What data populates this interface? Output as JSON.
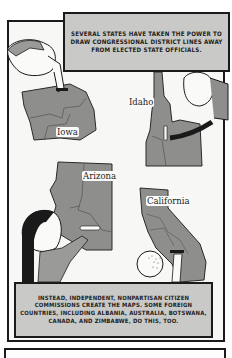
{
  "captions": {
    "top": "Several states have taken the power to draw congressional district lines away from elected state officials.",
    "bottom": "Instead, independent, nonpartisan citizen commissions create the maps. Some foreign countries, including Albania, Australia, Botswana, Canada, and Zimbabwe, do this, too."
  },
  "state_labels": {
    "iowa": "Iowa",
    "idaho": "Idaho",
    "arizona": "Arizona",
    "california": "California"
  },
  "colors": {
    "state_fill": "#8e8e8c",
    "caption_fill": "#c9c9c7",
    "ink": "#1a1a1a",
    "panel_bg": "#f7f7f5"
  }
}
